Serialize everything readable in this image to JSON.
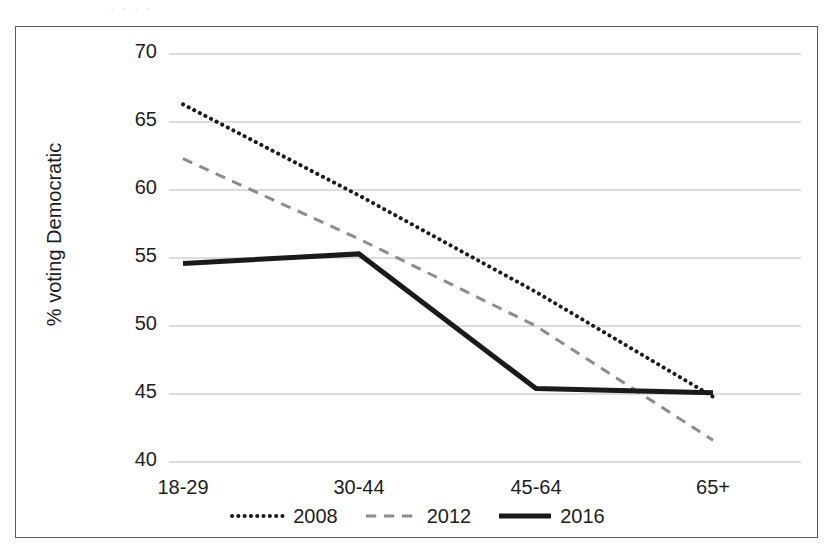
{
  "scan_artifact_text": "· ·      · ·",
  "axes": {
    "ylabel": "% voting Democratic",
    "xlabel": "",
    "yticks": [
      "70",
      "65",
      "60",
      "55",
      "50",
      "45",
      "40"
    ],
    "xticks": [
      "18-29",
      "30-44",
      "45-64",
      "65+"
    ]
  },
  "legend": {
    "items": [
      {
        "label": "2008",
        "style": "dotted",
        "color": "#1a1a1a",
        "swatch_name": "legend-swatch-2008"
      },
      {
        "label": "2012",
        "style": "dashed",
        "color": "#8c8c8c",
        "swatch_name": "legend-swatch-2012"
      },
      {
        "label": "2016",
        "style": "solid",
        "color": "#1a1a1a",
        "swatch_name": "legend-swatch-2016"
      }
    ]
  },
  "chart_data": {
    "type": "line",
    "title": "",
    "xlabel": "",
    "ylabel": "% voting Democratic",
    "categories": [
      "18-29",
      "30-44",
      "45-64",
      "65+"
    ],
    "ylim": [
      40,
      70
    ],
    "yticks": [
      40,
      45,
      50,
      55,
      60,
      65,
      70
    ],
    "grid": true,
    "legend_position": "bottom",
    "series": [
      {
        "name": "2008",
        "values": [
          66.3,
          59.6,
          52.5,
          44.8
        ],
        "color": "#1a1a1a",
        "linestyle": "dotted",
        "linewidth": 4
      },
      {
        "name": "2012",
        "values": [
          62.3,
          56.4,
          50.0,
          41.6
        ],
        "color": "#8c8c8c",
        "linestyle": "dashed",
        "linewidth": 3
      },
      {
        "name": "2016",
        "values": [
          54.6,
          55.3,
          45.4,
          45.1
        ],
        "color": "#1a1a1a",
        "linestyle": "solid",
        "linewidth": 5
      }
    ]
  }
}
